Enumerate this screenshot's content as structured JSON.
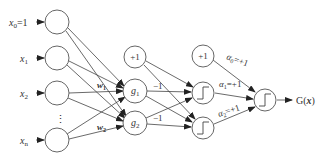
{
  "diagram": {
    "type": "neural-network",
    "inputs": [
      {
        "label": "x",
        "sub": "0",
        "suffix": "=1"
      },
      {
        "label": "x",
        "sub": "1",
        "suffix": ""
      },
      {
        "label": "x",
        "sub": "2",
        "suffix": ""
      },
      {
        "label": "x",
        "sub": "n",
        "suffix": ""
      }
    ],
    "ellipsis": "⋮",
    "weights": {
      "w1": "w",
      "w1_sub": "1",
      "w2": "w",
      "w2_sub": "2"
    },
    "bias_hidden": "+1",
    "hidden": [
      {
        "label": "g",
        "sub": "1"
      },
      {
        "label": "g",
        "sub": "2"
      }
    ],
    "edge_hidden_to_step": [
      "−1",
      "−1"
    ],
    "bias_step": "+1",
    "alphas": [
      {
        "label": "α",
        "sub": "0",
        "value": "=+1"
      },
      {
        "label": "α",
        "sub": "1",
        "value": "=+1"
      },
      {
        "label": "α",
        "sub": "2",
        "value": "=+1"
      }
    ],
    "output": {
      "label": "G(",
      "var": "x",
      "close": ")"
    }
  }
}
